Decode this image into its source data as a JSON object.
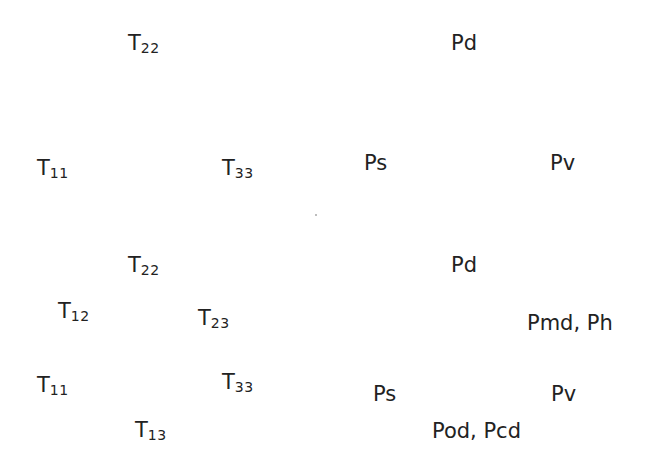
{
  "colors": {
    "dark": "#3b3b3b",
    "top_left_overlap": "#5c5c5c",
    "right": "#c5c5c5",
    "top_right_overlap": "#e2e2e2",
    "bottom_overlap": "#d9d9d9",
    "center": "#ffffff",
    "outline": "#8a8a8a"
  },
  "panels": [
    {
      "id": "top-left",
      "labels": {
        "top": {
          "main": "T",
          "sub": "22"
        },
        "left": {
          "main": "T",
          "sub": "11"
        },
        "right": {
          "main": "T",
          "sub": "33"
        }
      }
    },
    {
      "id": "top-right",
      "labels": {
        "top": "Pd",
        "left": "Ps",
        "right": "Pv"
      }
    },
    {
      "id": "bottom-left",
      "labels": {
        "top": {
          "main": "T",
          "sub": "22"
        },
        "top_left": {
          "main": "T",
          "sub": "12"
        },
        "top_right": {
          "main": "T",
          "sub": "23"
        },
        "left": {
          "main": "T",
          "sub": "11"
        },
        "right": {
          "main": "T",
          "sub": "33"
        },
        "bottom": {
          "main": "T",
          "sub": "13"
        }
      }
    },
    {
      "id": "bottom-right",
      "labels": {
        "top": "Pd",
        "top_right": "Pmd, Ph",
        "left": "Ps",
        "right": "Pv",
        "bottom": "Pod, Pcd"
      }
    }
  ]
}
